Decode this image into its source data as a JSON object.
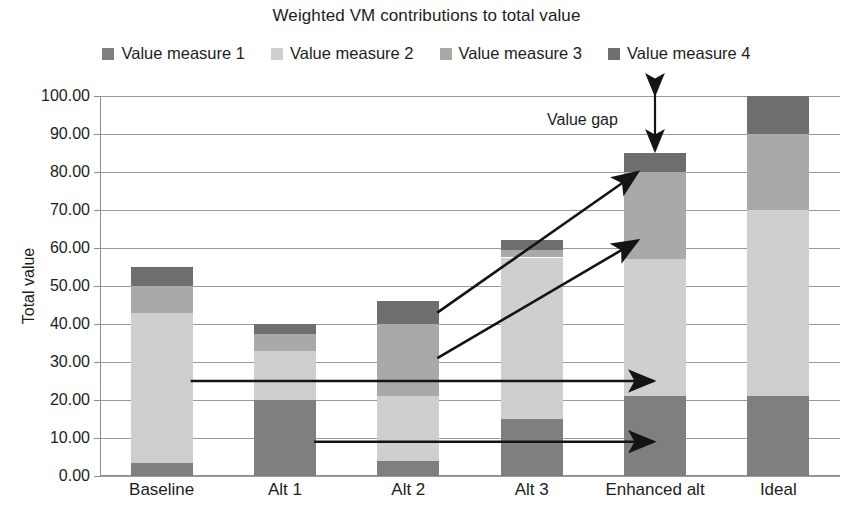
{
  "chart_data": {
    "type": "bar",
    "stacked": true,
    "title": "Weighted VM contributions to total value",
    "xlabel": "",
    "ylabel": "Total value",
    "categories": [
      "Baseline",
      "Alt 1",
      "Alt 2",
      "Alt 3",
      "Enhanced alt",
      "Ideal"
    ],
    "series": [
      {
        "name": "Value measure 1",
        "color": "#7f7f7f",
        "values": [
          3.5,
          20.0,
          4.0,
          15.0,
          21.0,
          21.0
        ]
      },
      {
        "name": "Value measure 2",
        "color": "#cfcfcf",
        "values": [
          39.5,
          13.0,
          17.0,
          42.5,
          36.0,
          49.0
        ]
      },
      {
        "name": "Value measure 3",
        "color": "#a9a9a9",
        "values": [
          7.0,
          4.5,
          19.0,
          2.0,
          23.0,
          20.0
        ]
      },
      {
        "name": "Value measure 4",
        "color": "#6e6e6e",
        "values": [
          5.0,
          2.5,
          6.0,
          2.5,
          5.0,
          10.0
        ]
      }
    ],
    "totals": [
      55.0,
      40.0,
      46.0,
      62.0,
      85.0,
      100.0
    ],
    "ylim": [
      0,
      100
    ],
    "ytick_step": 10,
    "ytick_labels": [
      "0.00",
      "10.00",
      "20.00",
      "30.00",
      "40.00",
      "50.00",
      "60.00",
      "70.00",
      "80.00",
      "90.00",
      "100.00"
    ],
    "grid": true,
    "legend_position": "top",
    "annotations": [
      {
        "name": "value-gap",
        "label": "Value gap",
        "type": "double-arrow-vertical",
        "from": 100.0,
        "to": 85.0,
        "at_category": "Enhanced alt"
      },
      {
        "name": "baseline-to-enhanced-arrow",
        "label": "",
        "type": "arrow-horizontal",
        "level": 25.0,
        "from_category": "Baseline",
        "to_category": "Enhanced alt"
      },
      {
        "name": "alt1-to-enhanced-arrow",
        "label": "",
        "type": "arrow-horizontal",
        "level": 9.0,
        "from_category": "Alt 1",
        "to_category": "Enhanced alt"
      },
      {
        "name": "alt2-to-enhanced-upper-arrow",
        "label": "",
        "type": "arrow-diagonal",
        "from": 43.0,
        "to": 80.0,
        "from_category": "Alt 2",
        "to_category": "Enhanced alt"
      },
      {
        "name": "alt2-to-enhanced-lower-arrow",
        "label": "",
        "type": "arrow-diagonal",
        "from": 31.0,
        "to": 62.0,
        "from_category": "Alt 2",
        "to_category": "Enhanced alt"
      }
    ]
  },
  "legend": {
    "items": [
      {
        "label": "Value measure 1",
        "color": "#7f7f7f"
      },
      {
        "label": "Value measure 2",
        "color": "#cfcfcf"
      },
      {
        "label": "Value measure 3",
        "color": "#a9a9a9"
      },
      {
        "label": "Value measure 4",
        "color": "#6e6e6e"
      }
    ]
  },
  "colors": {
    "grid": "#9b9b9b",
    "axis": "#8e8e8e",
    "text": "#1d1d1d",
    "annotation": "#141414",
    "background": "#ffffff"
  }
}
